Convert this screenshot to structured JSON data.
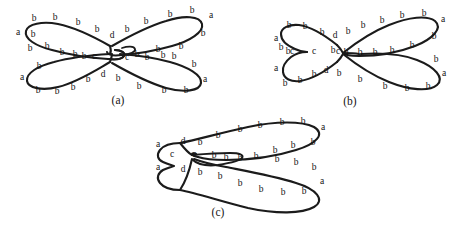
{
  "page": {
    "width": 469,
    "height": 229,
    "background_color": "#ffffff",
    "ink_color": "#1b1b1b"
  },
  "figures": [
    {
      "id": "a",
      "caption": "(a)",
      "caption_pos": [
        118,
        100
      ],
      "shape": "bowtie-four-lobes",
      "labels": [
        {
          "text": "a",
          "x": 18,
          "y": 33
        },
        {
          "text": "b",
          "x": 34,
          "y": 19
        },
        {
          "text": "b",
          "x": 55,
          "y": 18
        },
        {
          "text": "b",
          "x": 78,
          "y": 23
        },
        {
          "text": "b",
          "x": 97,
          "y": 30
        },
        {
          "text": "d",
          "x": 112,
          "y": 36
        },
        {
          "text": "b",
          "x": 127,
          "y": 30
        },
        {
          "text": "b",
          "x": 146,
          "y": 22
        },
        {
          "text": "b",
          "x": 170,
          "y": 15
        },
        {
          "text": "b",
          "x": 192,
          "y": 11
        },
        {
          "text": "a",
          "x": 211,
          "y": 16
        },
        {
          "text": "b",
          "x": 203,
          "y": 34
        },
        {
          "text": "b",
          "x": 181,
          "y": 47
        },
        {
          "text": "b",
          "x": 163,
          "y": 56
        },
        {
          "text": "b",
          "x": 147,
          "y": 58
        },
        {
          "text": "b",
          "x": 137,
          "y": 56
        },
        {
          "text": "c",
          "x": 127,
          "y": 58
        },
        {
          "text": "c",
          "x": 94,
          "y": 57
        },
        {
          "text": "b",
          "x": 84,
          "y": 57
        },
        {
          "text": "b",
          "x": 75,
          "y": 56
        },
        {
          "text": "b",
          "x": 62,
          "y": 53
        },
        {
          "text": "b",
          "x": 47,
          "y": 47
        },
        {
          "text": "b",
          "x": 33,
          "y": 35
        },
        {
          "text": "b",
          "x": 30,
          "y": 49
        },
        {
          "text": "b",
          "x": 39,
          "y": 67
        },
        {
          "text": "a",
          "x": 22,
          "y": 78
        },
        {
          "text": "b",
          "x": 38,
          "y": 91
        },
        {
          "text": "b",
          "x": 57,
          "y": 92
        },
        {
          "text": "b",
          "x": 73,
          "y": 88
        },
        {
          "text": "b",
          "x": 88,
          "y": 80
        },
        {
          "text": "d",
          "x": 103,
          "y": 75
        },
        {
          "text": "b",
          "x": 118,
          "y": 79
        },
        {
          "text": "b",
          "x": 139,
          "y": 87
        },
        {
          "text": "b",
          "x": 164,
          "y": 91
        },
        {
          "text": "b",
          "x": 186,
          "y": 91
        },
        {
          "text": "a",
          "x": 205,
          "y": 80
        },
        {
          "text": "b",
          "x": 194,
          "y": 65
        },
        {
          "text": "b",
          "x": 174,
          "y": 57
        },
        {
          "text": "b",
          "x": 158,
          "y": 50
        }
      ]
    },
    {
      "id": "b",
      "caption": "(b)",
      "caption_pos": [
        350,
        101
      ],
      "shape": "bowtie-pinched-left",
      "labels": [
        {
          "text": "a",
          "x": 276,
          "y": 39
        },
        {
          "text": "b",
          "x": 289,
          "y": 26
        },
        {
          "text": "b",
          "x": 305,
          "y": 27
        },
        {
          "text": "b",
          "x": 322,
          "y": 33
        },
        {
          "text": "d",
          "x": 335,
          "y": 36
        },
        {
          "text": "b",
          "x": 348,
          "y": 32
        },
        {
          "text": "b",
          "x": 363,
          "y": 26
        },
        {
          "text": "b",
          "x": 382,
          "y": 21
        },
        {
          "text": "b",
          "x": 402,
          "y": 16
        },
        {
          "text": "b",
          "x": 424,
          "y": 14
        },
        {
          "text": "a",
          "x": 443,
          "y": 20
        },
        {
          "text": "b",
          "x": 434,
          "y": 37
        },
        {
          "text": "b",
          "x": 412,
          "y": 46
        },
        {
          "text": "b",
          "x": 392,
          "y": 51
        },
        {
          "text": "b",
          "x": 375,
          "y": 53
        },
        {
          "text": "b",
          "x": 360,
          "y": 53
        },
        {
          "text": "b",
          "x": 346,
          "y": 53
        },
        {
          "text": "b",
          "x": 333,
          "y": 51
        },
        {
          "text": "c",
          "x": 338,
          "y": 52
        },
        {
          "text": "c",
          "x": 314,
          "y": 52
        },
        {
          "text": "c",
          "x": 292,
          "y": 52
        },
        {
          "text": "b",
          "x": 281,
          "y": 48
        },
        {
          "text": "b",
          "x": 288,
          "y": 52
        },
        {
          "text": "a",
          "x": 276,
          "y": 69
        },
        {
          "text": "b",
          "x": 285,
          "y": 84
        },
        {
          "text": "b",
          "x": 300,
          "y": 81
        },
        {
          "text": "b",
          "x": 314,
          "y": 75
        },
        {
          "text": "d",
          "x": 326,
          "y": 71
        },
        {
          "text": "b",
          "x": 339,
          "y": 74
        },
        {
          "text": "b",
          "x": 360,
          "y": 80
        },
        {
          "text": "b",
          "x": 385,
          "y": 87
        },
        {
          "text": "b",
          "x": 407,
          "y": 89
        },
        {
          "text": "b",
          "x": 428,
          "y": 87
        },
        {
          "text": "a",
          "x": 444,
          "y": 74
        },
        {
          "text": "b",
          "x": 436,
          "y": 60
        }
      ]
    },
    {
      "id": "c",
      "caption": "(c)",
      "caption_pos": [
        218,
        212
      ],
      "shape": "two-lobes-right-cusp-left",
      "labels": [
        {
          "text": "a",
          "x": 158,
          "y": 145
        },
        {
          "text": "d",
          "x": 183,
          "y": 142
        },
        {
          "text": "b",
          "x": 200,
          "y": 143
        },
        {
          "text": "b",
          "x": 218,
          "y": 136
        },
        {
          "text": "b",
          "x": 240,
          "y": 130
        },
        {
          "text": "b",
          "x": 260,
          "y": 126
        },
        {
          "text": "b",
          "x": 282,
          "y": 123
        },
        {
          "text": "b",
          "x": 303,
          "y": 122
        },
        {
          "text": "a",
          "x": 323,
          "y": 128
        },
        {
          "text": "b",
          "x": 313,
          "y": 143
        },
        {
          "text": "b",
          "x": 293,
          "y": 146
        },
        {
          "text": "b",
          "x": 275,
          "y": 151
        },
        {
          "text": "b",
          "x": 256,
          "y": 157
        },
        {
          "text": "b",
          "x": 240,
          "y": 159
        },
        {
          "text": "b",
          "x": 226,
          "y": 158
        },
        {
          "text": "b",
          "x": 214,
          "y": 156
        },
        {
          "text": "c",
          "x": 194,
          "y": 155
        },
        {
          "text": "c",
          "x": 172,
          "y": 155
        },
        {
          "text": "a",
          "x": 158,
          "y": 168
        },
        {
          "text": "d",
          "x": 183,
          "y": 170
        },
        {
          "text": "b",
          "x": 200,
          "y": 173
        },
        {
          "text": "b",
          "x": 220,
          "y": 177
        },
        {
          "text": "b",
          "x": 240,
          "y": 184
        },
        {
          "text": "b",
          "x": 261,
          "y": 190
        },
        {
          "text": "b",
          "x": 283,
          "y": 193
        },
        {
          "text": "b",
          "x": 304,
          "y": 192
        },
        {
          "text": "a",
          "x": 322,
          "y": 182
        },
        {
          "text": "b",
          "x": 314,
          "y": 168
        },
        {
          "text": "b",
          "x": 296,
          "y": 163
        },
        {
          "text": "b",
          "x": 277,
          "y": 160
        }
      ]
    }
  ],
  "legend": {
    "vertex_letters": [
      "a",
      "b",
      "c",
      "d"
    ]
  }
}
